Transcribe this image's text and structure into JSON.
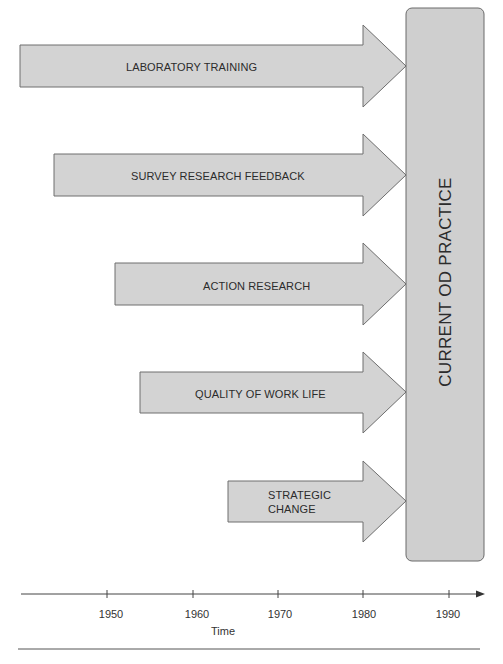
{
  "colors": {
    "arrow_fill": "#d3d3d3",
    "arrow_stroke": "#6e6e6e",
    "box_fill": "#cfcfcf",
    "box_stroke": "#6a6a6a",
    "axis": "#444444"
  },
  "arrows": [
    {
      "label": "LABORATORY TRAINING",
      "start_x": 20,
      "center_y": 66
    },
    {
      "label": "SURVEY RESEARCH FEEDBACK",
      "start_x": 54,
      "center_y": 175
    },
    {
      "label": "ACTION RESEARCH",
      "start_x": 115,
      "center_y": 284
    },
    {
      "label": "QUALITY OF WORK LIFE",
      "start_x": 140,
      "center_y": 392
    },
    {
      "label_line1": "STRATEGIC",
      "label_line2": "CHANGE",
      "start_x": 228,
      "center_y": 501
    }
  ],
  "target_box": {
    "label": "CURRENT OD PRACTICE"
  },
  "timeline": {
    "ticks": [
      "1950",
      "1960",
      "1970",
      "1980",
      "1990"
    ],
    "axis_label": "Time"
  }
}
